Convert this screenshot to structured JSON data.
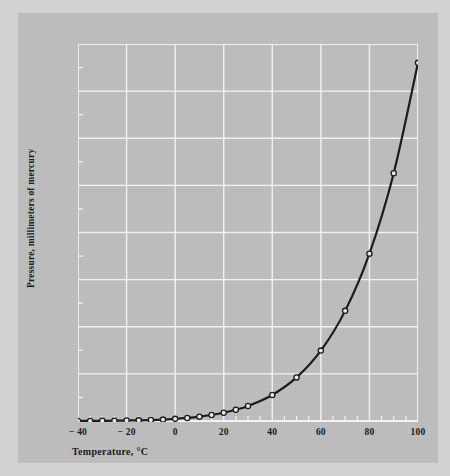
{
  "chart_data": {
    "type": "line",
    "title": "",
    "xlabel": "Temperature, °C",
    "ylabel": "Pressure, millimeters of mercury",
    "xlim": [
      -40,
      100
    ],
    "ylim": [
      0,
      800
    ],
    "xticks": [
      -40,
      -20,
      0,
      20,
      40,
      60,
      80,
      100
    ],
    "xticklabels": [
      "− 40",
      "− 20",
      "0",
      "20",
      "40",
      "60",
      "80",
      "100"
    ],
    "yticks": [
      0,
      100,
      200,
      300,
      400,
      500,
      600,
      700,
      800
    ],
    "yticklabels": [
      "0",
      "100",
      "200",
      "300",
      "400",
      "500",
      "600",
      "700",
      "800"
    ],
    "x_minor_tick_step": 5,
    "y_minor_tick_step": 50,
    "grid": true,
    "grid_color": "#f2f2f2",
    "legend": null,
    "line_color": "#1c1c1c",
    "marker": "open-circle",
    "marker_face_color": "#e8e8e8",
    "background_color": "#bdbdbd",
    "x": [
      -40,
      -35,
      -30,
      -25,
      -20,
      -15,
      -10,
      -5,
      0,
      5,
      10,
      15,
      20,
      25,
      30,
      40,
      50,
      60,
      70,
      80,
      90,
      100
    ],
    "values": [
      0.1,
      0.2,
      0.4,
      0.6,
      1,
      1.4,
      2,
      3,
      4.6,
      6.5,
      9.2,
      12.8,
      17.5,
      23.8,
      31.8,
      55.3,
      92.5,
      149.4,
      233.7,
      355.1,
      525.8,
      760
    ],
    "series": [
      {
        "name": "Vapor pressure of water",
        "points": [
          {
            "x": -40,
            "y": 0.1
          },
          {
            "x": -35,
            "y": 0.2
          },
          {
            "x": -30,
            "y": 0.4
          },
          {
            "x": -25,
            "y": 0.6
          },
          {
            "x": -20,
            "y": 1
          },
          {
            "x": -15,
            "y": 1.4
          },
          {
            "x": -10,
            "y": 2
          },
          {
            "x": -5,
            "y": 3
          },
          {
            "x": 0,
            "y": 4.6
          },
          {
            "x": 5,
            "y": 6.5
          },
          {
            "x": 10,
            "y": 9.2
          },
          {
            "x": 15,
            "y": 12.8
          },
          {
            "x": 20,
            "y": 17.5
          },
          {
            "x": 25,
            "y": 23.8
          },
          {
            "x": 30,
            "y": 31.8
          },
          {
            "x": 40,
            "y": 55.3
          },
          {
            "x": 50,
            "y": 92.5
          },
          {
            "x": 60,
            "y": 149.4
          },
          {
            "x": 70,
            "y": 233.7
          },
          {
            "x": 80,
            "y": 355.1
          },
          {
            "x": 90,
            "y": 525.8
          },
          {
            "x": 100,
            "y": 760
          }
        ]
      }
    ]
  }
}
